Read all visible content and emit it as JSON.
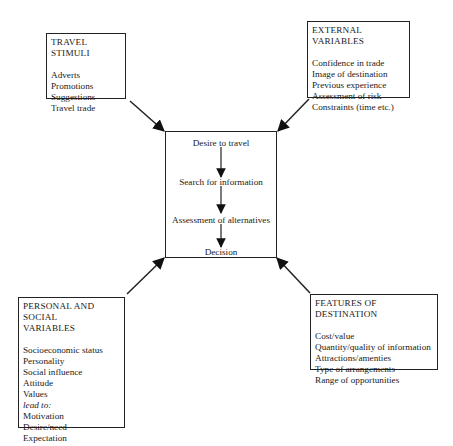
{
  "diagram": {
    "type": "influence-diagram",
    "boxes": {
      "travel_stimuli": {
        "title": "TRAVEL STIMULI",
        "items": [
          "Adverts",
          "Promotions",
          "Suggestions",
          "Travel trade"
        ]
      },
      "external_variables": {
        "title": "EXTERNAL VARIABLES",
        "items": [
          "Confidence in trade",
          "Image of destination",
          "Previous experience",
          "Assessment of risk",
          "Constraints (time etc.)"
        ]
      },
      "personal_social": {
        "title_line1": "PERSONAL AND SOCIAL",
        "title_line2": "VARIABLES",
        "items": [
          "Socioeconomic status",
          "Personality",
          "Social influence",
          "Attitude",
          "Values"
        ],
        "connector": "lead to:",
        "outcomes": [
          "Motivation",
          "Desire/need",
          "Expectation"
        ]
      },
      "features_destination": {
        "title": "FEATURES OF DESTINATION",
        "items": [
          "Cost/value",
          "Quantity/quality of information",
          "Attractions/amenties",
          "Type of arrangements",
          "Range of opportunities"
        ]
      }
    },
    "center_process": {
      "steps": [
        "Desire to travel",
        "Search for information",
        "Assessment of alternatives",
        "Decision"
      ]
    },
    "edges": [
      {
        "from": "travel_stimuli",
        "to": "center_process"
      },
      {
        "from": "external_variables",
        "to": "center_process"
      },
      {
        "from": "personal_social",
        "to": "center_process"
      },
      {
        "from": "features_destination",
        "to": "center_process"
      }
    ]
  }
}
